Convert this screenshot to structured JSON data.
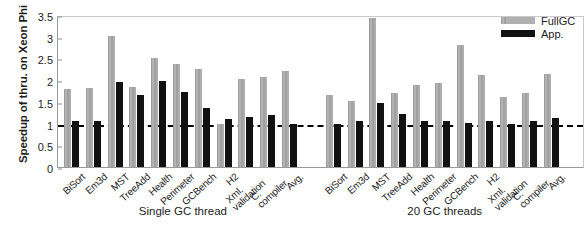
{
  "chart_data": {
    "type": "bar",
    "title": "",
    "xlabel": "",
    "ylabel": "Speedup of thru. on Xeon Phi",
    "ylim": [
      0,
      3.5
    ],
    "ytick_labels": [
      "0",
      "0.5",
      "1",
      "1.5",
      "2",
      "2.5",
      "3",
      "3.5"
    ],
    "ytick_values": [
      0,
      0.5,
      1,
      1.5,
      2,
      2.5,
      3,
      3.5
    ],
    "grid": false,
    "legend_position": "top-right",
    "reference_line": 1.0,
    "legend": [
      {
        "name": "FullGC",
        "color": "#a8a8a8"
      },
      {
        "name": "App.",
        "color": "#111111"
      }
    ],
    "panels": [
      {
        "caption": "Single GC thread",
        "categories": [
          "BiSort",
          "Em3d",
          "MST",
          "TreeAdd",
          "Health",
          "Perimeter",
          "GCBench",
          "H2",
          "Xml.validation",
          "C.compiler",
          "Avg."
        ],
        "series": [
          {
            "name": "FullGC",
            "values": [
              1.8,
              1.81,
              3.01,
              1.84,
              2.5,
              2.38,
              2.26,
              1.0,
              2.03,
              2.07,
              2.21
            ]
          },
          {
            "name": "App.",
            "values": [
              1.06,
              1.07,
              1.96,
              1.66,
              1.98,
              1.72,
              1.35,
              1.1,
              1.15,
              1.2,
              1.0
            ]
          }
        ]
      },
      {
        "caption": "20 GC threads",
        "categories": [
          "BiSort",
          "Em3d",
          "MST",
          "TreeAdd",
          "Health",
          "Perimeter",
          "GCBench",
          "H2",
          "Xml.validation",
          "C.compiler",
          "Avg."
        ],
        "series": [
          {
            "name": "FullGC",
            "values": [
              1.66,
              1.52,
              3.44,
              1.7,
              1.89,
              1.94,
              2.8,
              2.13,
              1.62,
              1.7,
              2.14
            ]
          },
          {
            "name": "App.",
            "values": [
              1.0,
              1.06,
              1.48,
              1.22,
              1.05,
              1.05,
              1.02,
              1.07,
              0.98,
              1.05,
              1.13
            ]
          }
        ]
      }
    ]
  }
}
